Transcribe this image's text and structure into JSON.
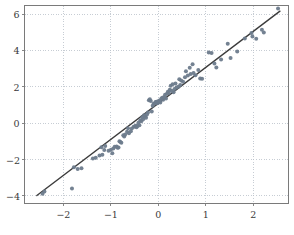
{
  "figure": {
    "background_color": "#ffffff",
    "frame_color": "#7a7a7a",
    "grid_color": "#b9c0c9",
    "point_color": "#6d7b8c",
    "line_color": "#3c3c3c",
    "tick_label_color": "#3a3a3a"
  },
  "chart_data": {
    "type": "scatter",
    "title": "",
    "subtitle": "",
    "xlabel": "",
    "ylabel": "",
    "xlim": [
      -2.82,
      2.74
    ],
    "ylim": [
      -4.42,
      6.47
    ],
    "xticks": [
      -2,
      -1,
      0,
      1,
      2
    ],
    "xticklabels": [
      "−2",
      "−1",
      "0",
      "1",
      "2"
    ],
    "yticks": [
      -4,
      -2,
      0,
      2,
      4,
      6
    ],
    "yticklabels": [
      "−4",
      "−2",
      "0",
      "2",
      "4",
      "6"
    ],
    "grid": true,
    "grid_style": "dotted",
    "legend": null,
    "legend_position": "none",
    "annotations": [],
    "series": [
      {
        "name": "observations",
        "type": "scatter",
        "marker": "circle",
        "marker_size": 2.0,
        "color": "#6d7b8c",
        "points": [
          [
            -2.44,
            -3.88
          ],
          [
            -2.4,
            -3.76
          ],
          [
            -1.82,
            -3.6
          ],
          [
            -1.78,
            -2.42
          ],
          [
            -1.7,
            -2.52
          ],
          [
            -1.62,
            -2.48
          ],
          [
            -1.38,
            -1.94
          ],
          [
            -1.32,
            -1.9
          ],
          [
            -1.24,
            -1.78
          ],
          [
            -1.2,
            -1.32
          ],
          [
            -1.18,
            -1.74
          ],
          [
            -1.14,
            -1.48
          ],
          [
            -1.12,
            -1.26
          ],
          [
            -1.05,
            -1.52
          ],
          [
            -1.0,
            -1.46
          ],
          [
            -0.97,
            -1.66
          ],
          [
            -0.95,
            -1.4
          ],
          [
            -0.92,
            -1.3
          ],
          [
            -0.88,
            -1.28
          ],
          [
            -0.86,
            -1.36
          ],
          [
            -0.84,
            -1.34
          ],
          [
            -0.82,
            -1.0
          ],
          [
            -0.8,
            -1.04
          ],
          [
            -0.78,
            -1.08
          ],
          [
            -0.74,
            -0.66
          ],
          [
            -0.72,
            -0.74
          ],
          [
            -0.7,
            -0.62
          ],
          [
            -0.66,
            -0.48
          ],
          [
            -0.64,
            -0.28
          ],
          [
            -0.62,
            -0.56
          ],
          [
            -0.58,
            -0.44
          ],
          [
            -0.56,
            -0.3
          ],
          [
            -0.52,
            -0.2
          ],
          [
            -0.5,
            -0.18
          ],
          [
            -0.48,
            -0.14
          ],
          [
            -0.46,
            -0.22
          ],
          [
            -0.44,
            -0.16
          ],
          [
            -0.42,
            0.02
          ],
          [
            -0.4,
            -0.12
          ],
          [
            -0.38,
            0.16
          ],
          [
            -0.36,
            0.1
          ],
          [
            -0.34,
            0.32
          ],
          [
            -0.32,
            0.22
          ],
          [
            -0.3,
            0.44
          ],
          [
            -0.28,
            0.36
          ],
          [
            -0.26,
            0.3
          ],
          [
            -0.24,
            0.48
          ],
          [
            -0.22,
            0.58
          ],
          [
            -0.2,
            1.26
          ],
          [
            -0.18,
            1.32
          ],
          [
            -0.16,
            1.22
          ],
          [
            -0.14,
            0.64
          ],
          [
            -0.12,
            0.96
          ],
          [
            -0.1,
            1.06
          ],
          [
            -0.08,
            1.08
          ],
          [
            -0.06,
            1.16
          ],
          [
            -0.04,
            1.18
          ],
          [
            -0.02,
            1.1
          ],
          [
            0.0,
            1.2
          ],
          [
            0.02,
            1.24
          ],
          [
            0.04,
            1.14
          ],
          [
            0.06,
            1.34
          ],
          [
            0.08,
            1.4
          ],
          [
            0.1,
            1.28
          ],
          [
            0.12,
            1.44
          ],
          [
            0.14,
            1.56
          ],
          [
            0.16,
            1.36
          ],
          [
            0.18,
            1.62
          ],
          [
            0.2,
            1.72
          ],
          [
            0.22,
            1.66
          ],
          [
            0.24,
            1.84
          ],
          [
            0.26,
            2.06
          ],
          [
            0.28,
            1.78
          ],
          [
            0.3,
            2.14
          ],
          [
            0.32,
            1.7
          ],
          [
            0.34,
            1.88
          ],
          [
            0.36,
            2.18
          ],
          [
            0.38,
            1.96
          ],
          [
            0.42,
            2.0
          ],
          [
            0.44,
            2.42
          ],
          [
            0.46,
            2.1
          ],
          [
            0.48,
            2.34
          ],
          [
            0.52,
            2.28
          ],
          [
            0.56,
            2.52
          ],
          [
            0.58,
            2.86
          ],
          [
            0.62,
            2.62
          ],
          [
            0.66,
            3.04
          ],
          [
            0.68,
            2.7
          ],
          [
            0.72,
            3.24
          ],
          [
            0.74,
            2.76
          ],
          [
            0.78,
            2.64
          ],
          [
            0.84,
            2.92
          ],
          [
            0.88,
            2.46
          ],
          [
            0.92,
            2.44
          ],
          [
            1.06,
            3.88
          ],
          [
            1.12,
            3.86
          ],
          [
            1.18,
            3.28
          ],
          [
            1.22,
            3.06
          ],
          [
            1.32,
            3.5
          ],
          [
            1.46,
            4.36
          ],
          [
            1.52,
            3.58
          ],
          [
            1.66,
            3.94
          ],
          [
            1.82,
            4.66
          ],
          [
            1.96,
            4.96
          ],
          [
            1.98,
            4.76
          ],
          [
            2.06,
            4.64
          ],
          [
            2.18,
            5.14
          ],
          [
            2.22,
            4.98
          ],
          [
            2.52,
            6.3
          ]
        ]
      },
      {
        "name": "fit-line",
        "type": "line",
        "color": "#3c3c3c",
        "linewidth": 1.4,
        "endpoints": [
          [
            -2.56,
            -3.98
          ],
          [
            2.56,
            6.16
          ]
        ],
        "slope": 1.98,
        "intercept": 1.09
      }
    ]
  }
}
